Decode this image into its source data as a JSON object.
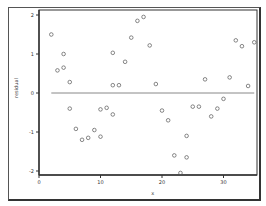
{
  "chart_data": {
    "type": "scatter",
    "title": "",
    "xlabel": "x",
    "ylabel": "residual",
    "xlim": [
      -1,
      37
    ],
    "ylim": [
      -2.1,
      2.1
    ],
    "xticks": [
      0,
      10,
      20,
      30
    ],
    "yticks": [
      -2,
      -1,
      0,
      1,
      2
    ],
    "grid": false,
    "legend": null,
    "reference_line": {
      "y": 0,
      "x_from": 2,
      "x_to": 35
    },
    "points": [
      {
        "x": 2,
        "y": 1.5
      },
      {
        "x": 3,
        "y": 0.58
      },
      {
        "x": 4,
        "y": 1.0
      },
      {
        "x": 4,
        "y": 0.65
      },
      {
        "x": 5,
        "y": 0.28
      },
      {
        "x": 5,
        "y": -0.4
      },
      {
        "x": 6,
        "y": -0.92
      },
      {
        "x": 7,
        "y": -1.2
      },
      {
        "x": 8,
        "y": -1.15
      },
      {
        "x": 9,
        "y": -0.95
      },
      {
        "x": 10,
        "y": -0.42
      },
      {
        "x": 10,
        "y": -1.12
      },
      {
        "x": 11,
        "y": -0.38
      },
      {
        "x": 12,
        "y": -0.55
      },
      {
        "x": 12,
        "y": 1.03
      },
      {
        "x": 12,
        "y": 0.2
      },
      {
        "x": 13,
        "y": 0.2
      },
      {
        "x": 14,
        "y": 0.8
      },
      {
        "x": 15,
        "y": 1.42
      },
      {
        "x": 16,
        "y": 1.85
      },
      {
        "x": 17,
        "y": 1.95
      },
      {
        "x": 18,
        "y": 1.22
      },
      {
        "x": 19,
        "y": 0.23
      },
      {
        "x": 20,
        "y": -0.45
      },
      {
        "x": 21,
        "y": -0.7
      },
      {
        "x": 22,
        "y": -1.6
      },
      {
        "x": 23,
        "y": -2.05
      },
      {
        "x": 24,
        "y": -1.1
      },
      {
        "x": 24,
        "y": -1.65
      },
      {
        "x": 25,
        "y": -0.35
      },
      {
        "x": 26,
        "y": -0.35
      },
      {
        "x": 27,
        "y": 0.35
      },
      {
        "x": 28,
        "y": -0.6
      },
      {
        "x": 29,
        "y": -0.4
      },
      {
        "x": 30,
        "y": -0.15
      },
      {
        "x": 31,
        "y": 0.4
      },
      {
        "x": 32,
        "y": 1.35
      },
      {
        "x": 33,
        "y": 1.2
      },
      {
        "x": 34,
        "y": 0.18
      },
      {
        "x": 35,
        "y": 1.3
      }
    ]
  },
  "layout": {
    "plot_left": 39,
    "plot_top": 10,
    "plot_right": 257,
    "plot_bottom": 175,
    "x0_px": 39,
    "px_per_x": 6.15,
    "y0_px": 93,
    "px_per_y": 39,
    "marker_color": "#555555",
    "line_color": "#888888",
    "axis_color": "#333333"
  }
}
